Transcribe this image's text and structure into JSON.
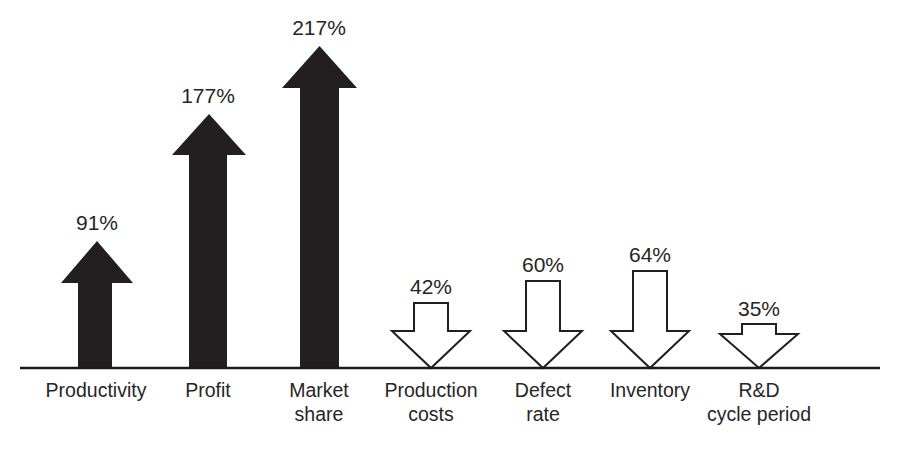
{
  "chart_data": {
    "type": "bar",
    "title": "",
    "subtitle": "",
    "xlabel": "",
    "ylabel": "",
    "grid": false,
    "legend": false,
    "axis": {
      "baseline_only": true,
      "baseline_color": "#1a1a1a"
    },
    "units": "percent",
    "categories": [
      "Productivity",
      "Profit",
      "Market share",
      "Production costs",
      "Defect rate",
      "Inventory",
      "R&D cycle period"
    ],
    "values": [
      91,
      177,
      217,
      42,
      60,
      64,
      35
    ],
    "value_labels": [
      "91%",
      "177%",
      "217%",
      "42%",
      "60%",
      "64%",
      "35%"
    ],
    "directions": [
      "up",
      "up",
      "up",
      "down",
      "down",
      "down",
      "down"
    ],
    "styles": [
      "filled",
      "filled",
      "filled",
      "outline",
      "outline",
      "outline",
      "outline"
    ],
    "series": [
      {
        "name": "Improvement (increase)",
        "direction": "up",
        "fill": "#231f20",
        "items": [
          {
            "category": "Productivity",
            "value": 91,
            "label": "91%"
          },
          {
            "category": "Profit",
            "value": 177,
            "label": "177%"
          },
          {
            "category": "Market share",
            "value": 217,
            "label": "217%"
          }
        ]
      },
      {
        "name": "Improvement (reduction)",
        "direction": "down",
        "fill": "#ffffff",
        "stroke": "#231f20",
        "items": [
          {
            "category": "Production costs",
            "value": 42,
            "label": "42%"
          },
          {
            "category": "Defect rate",
            "value": 60,
            "label": "60%"
          },
          {
            "category": "Inventory",
            "value": 64,
            "label": "64%"
          },
          {
            "category": "R&D cycle period",
            "value": 35,
            "label": "35%"
          }
        ]
      }
    ]
  },
  "arrows": [
    {
      "name": "productivity",
      "label": "91%",
      "label_x": 97,
      "label_y": 212,
      "cat_line1": "Productivity",
      "cat_line2": "",
      "cat_x": 96,
      "cat_y": 378,
      "direction": "up",
      "style": "filled",
      "shaft_left": 78,
      "shaft_right": 112,
      "head_left": 61,
      "head_right": 133,
      "tip_y": 241,
      "head_base_y": 283
    },
    {
      "name": "profit",
      "label": "177%",
      "label_x": 208,
      "label_y": 85,
      "cat_line1": "Profit",
      "cat_line2": "",
      "cat_x": 208,
      "cat_y": 378,
      "direction": "up",
      "style": "filled",
      "shaft_left": 189,
      "shaft_right": 227,
      "head_left": 172,
      "head_right": 246,
      "tip_y": 114,
      "head_base_y": 155
    },
    {
      "name": "market-share",
      "label": "217%",
      "label_x": 319,
      "label_y": 17,
      "cat_line1": "Market",
      "cat_line2": "share",
      "cat_x": 319,
      "cat_y": 378,
      "direction": "up",
      "style": "filled",
      "shaft_left": 300,
      "shaft_right": 339,
      "head_left": 282,
      "head_right": 357,
      "tip_y": 46,
      "head_base_y": 88
    },
    {
      "name": "production-costs",
      "label": "42%",
      "label_x": 431,
      "label_y": 276,
      "cat_line1": "Production",
      "cat_line2": "costs",
      "cat_x": 431,
      "cat_y": 378,
      "direction": "down",
      "style": "outline",
      "shaft_left": 414,
      "shaft_right": 448,
      "head_left": 392,
      "head_right": 470,
      "top_y": 303,
      "head_top_y": 331
    },
    {
      "name": "defect-rate",
      "label": "60%",
      "label_x": 543,
      "label_y": 254,
      "cat_line1": "Defect",
      "cat_line2": "rate",
      "cat_x": 543,
      "cat_y": 378,
      "direction": "down",
      "style": "outline",
      "shaft_left": 526,
      "shaft_right": 560,
      "head_left": 504,
      "head_right": 582,
      "top_y": 281,
      "head_top_y": 331
    },
    {
      "name": "inventory",
      "label": "64%",
      "label_x": 650,
      "label_y": 244,
      "cat_line1": "Inventory",
      "cat_line2": "",
      "cat_x": 650,
      "cat_y": 378,
      "direction": "down",
      "style": "outline",
      "shaft_left": 633,
      "shaft_right": 667,
      "head_left": 611,
      "head_right": 689,
      "top_y": 271,
      "head_top_y": 331
    },
    {
      "name": "rd-cycle-period",
      "label": "35%",
      "label_x": 759,
      "label_y": 298,
      "cat_line1": "R&D",
      "cat_line2": "cycle period",
      "cat_x": 759,
      "cat_y": 378,
      "direction": "down",
      "style": "outline",
      "shaft_left": 742,
      "shaft_right": 776,
      "head_left": 720,
      "head_right": 798,
      "top_y": 324,
      "head_top_y": 334
    }
  ],
  "baseline": {
    "x1": 20,
    "x2": 880,
    "y": 368
  },
  "colors": {
    "filled_arrow": "#231f20",
    "outline_arrow_fill": "#ffffff",
    "outline_arrow_stroke": "#231f20",
    "text": "#262626",
    "baseline": "#1a1a1a",
    "background": "#ffffff"
  }
}
